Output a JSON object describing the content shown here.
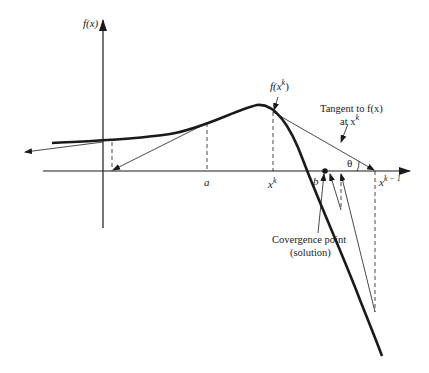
{
  "diagram": {
    "type": "newton-raphson-divergence-illustration",
    "axes": {
      "y_label": "f(x)",
      "x_label": ""
    },
    "points": {
      "a": {
        "label": "a"
      },
      "xk": {
        "label": "x",
        "sup": "k"
      },
      "b": {
        "label": "b"
      },
      "xk_minus_1": {
        "label": "x",
        "sup": "k − 1"
      }
    },
    "annotations": {
      "fxk": {
        "prefix": "f(x",
        "sup": "k",
        "suffix": ")"
      },
      "tangent_line1": "Tangent to f(x)",
      "tangent_line2_prefix": "at x",
      "tangent_line2_sup": "k",
      "theta": "θ",
      "convergence_line1": "Covergence point",
      "convergence_line2": "(solution)"
    },
    "colors": {
      "ink": "#1a1a1a",
      "background": "#ffffff"
    }
  }
}
